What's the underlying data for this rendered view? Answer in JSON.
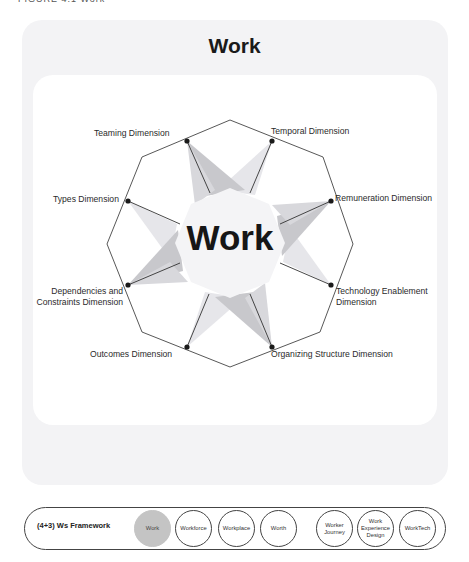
{
  "caption": "FIGURE 4.1  Work",
  "card": {
    "title": "Work",
    "center_label": "Work"
  },
  "dimensions": [
    {
      "id": "teaming",
      "label": "Teaming Dimension"
    },
    {
      "id": "temporal",
      "label": "Temporal Dimension"
    },
    {
      "id": "remuneration",
      "label": "Remuneration Dimension"
    },
    {
      "id": "technology",
      "label_line1": "Technology Enablement",
      "label_line2": "Dimension"
    },
    {
      "id": "organizing",
      "label": "Organizing Structure Dimension"
    },
    {
      "id": "outcomes",
      "label": "Outcomes Dimension"
    },
    {
      "id": "dependencies",
      "label_line1": "Dependencies and",
      "label_line2": "Constraints Dimension"
    },
    {
      "id": "types",
      "label": "Types Dimension"
    }
  ],
  "colors": {
    "outer_card": "#f3f3f5",
    "star_dark": "#c8c8cc",
    "star_light": "#e6e6ea",
    "center_fill": "#f4f4f6",
    "active_pill": "#c4c4c4",
    "line": "#333333"
  },
  "footer": {
    "label": "(4+3) Ws Framework",
    "items": [
      {
        "label": "Work",
        "active": true
      },
      {
        "label": "Workforce",
        "active": false
      },
      {
        "label": "Workplace",
        "active": false
      },
      {
        "label": "Worth",
        "active": false
      },
      {
        "label_line1": "Worker",
        "label_line2": "Journey",
        "active": false
      },
      {
        "label_line1": "Work",
        "label_line2": "Experience",
        "label_line3": "Design",
        "active": false
      },
      {
        "label": "WorkTech",
        "active": false
      }
    ]
  }
}
